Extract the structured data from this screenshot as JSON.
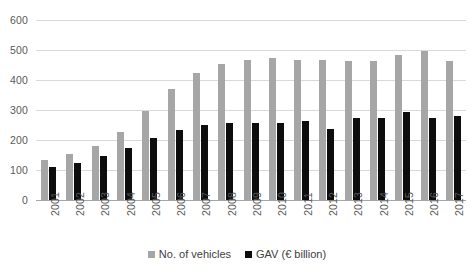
{
  "chart_data": {
    "type": "bar",
    "title": "",
    "subtitle": "",
    "xlabel": "",
    "ylabel": "",
    "ylim": [
      0,
      600
    ],
    "ytick_step": 100,
    "yticks": [
      "600",
      "500",
      "400",
      "300",
      "200",
      "100",
      "0"
    ],
    "grid": true,
    "legend_position": "bottom",
    "categories": [
      "2001",
      "2002",
      "2003",
      "2004",
      "2005",
      "2006",
      "2007",
      "2008",
      "2009",
      "2010",
      "2011",
      "2012",
      "2013",
      "2014",
      "2015",
      "2016",
      "2017"
    ],
    "series": [
      {
        "name": "No. of vehicles",
        "color": "#a6a6a6",
        "values": [
          135,
          153,
          180,
          228,
          297,
          370,
          422,
          455,
          468,
          472,
          468,
          466,
          463,
          464,
          484,
          498,
          463
        ]
      },
      {
        "name": "GAV (€ billion)",
        "color": "#0d0d0d",
        "values": [
          110,
          124,
          146,
          172,
          206,
          235,
          250,
          258,
          258,
          258,
          262,
          237,
          275,
          272,
          292,
          272,
          280
        ]
      }
    ]
  },
  "legend": {
    "entries": [
      {
        "label": "No. of vehicles",
        "swatch": "gray-square"
      },
      {
        "label": "GAV (€ billion)",
        "swatch": "black-square"
      }
    ]
  },
  "colors": {
    "series_vehicles": "#a6a6a6",
    "series_gav": "#0d0d0d",
    "gridline": "#d9d9d9",
    "axis": "#a6a6a6",
    "text": "#404040",
    "background": "#ffffff"
  }
}
